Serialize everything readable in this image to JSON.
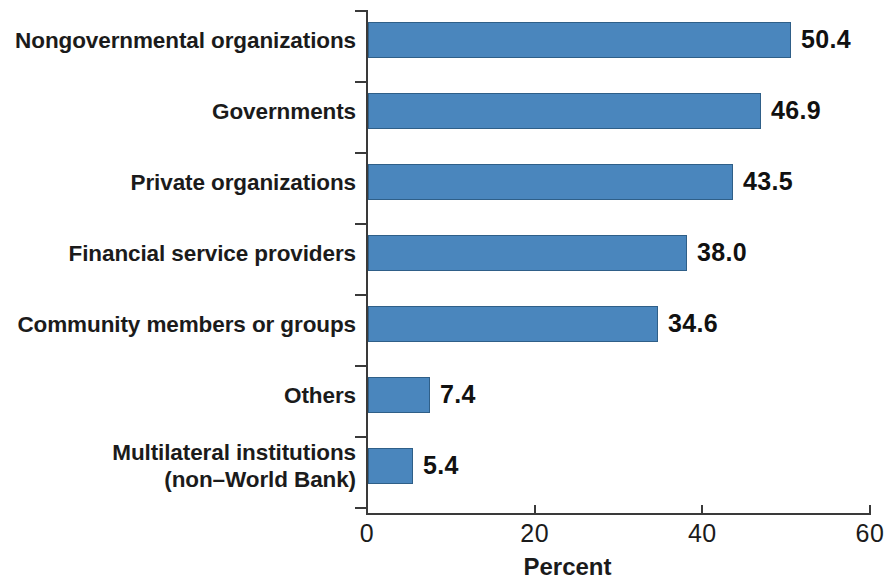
{
  "chart_data": {
    "type": "bar",
    "orientation": "horizontal",
    "title": "",
    "subtitle": "",
    "xlabel": "Percent",
    "ylabel": "",
    "xlim": [
      0,
      60
    ],
    "xticks": [
      0,
      20,
      40,
      60
    ],
    "xtick_labels": [
      "0",
      "20",
      "40",
      "60"
    ],
    "grid": false,
    "legend": false,
    "bar_color": "#4a86bd",
    "bar_edge_color": "#2f5f88",
    "axis_color": "#3a3a3a",
    "text_color": "#1b1b1b",
    "categories": [
      "Nongovernmental organizations",
      "Governments",
      "Private organizations",
      "Financial service providers",
      "Community members or groups",
      "Others",
      "Multilateral institutions\n(non–World Bank)"
    ],
    "values": [
      50.4,
      46.9,
      43.5,
      38.0,
      34.6,
      7.4,
      5.4
    ],
    "value_labels": [
      "50.4",
      "46.9",
      "43.5",
      "38.0",
      "34.6",
      "7.4",
      "5.4"
    ]
  }
}
